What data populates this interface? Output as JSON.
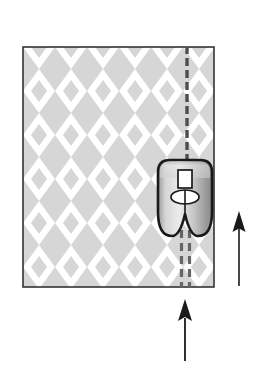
{
  "figure": {
    "title": "Presser foot stitching on argyle fabric",
    "canvas": {
      "width": 263,
      "height": 373,
      "background": "#ffffff"
    }
  },
  "fabric": {
    "name": "fabric-swatch",
    "x": 23,
    "y": 47,
    "width": 191,
    "height": 240,
    "fill": "#ffffff",
    "border_color": "#333333",
    "border_width": 1.6,
    "pattern": {
      "type": "argyle-diamond",
      "diamond_width": 32,
      "diamond_height": 44,
      "diamond_fill": "#cfcfcf",
      "diamond_opacity": 0.85
    }
  },
  "stitch_upper": {
    "name": "stitch-line-upper",
    "x": 187,
    "y_start": 47,
    "y_end": 163,
    "color": "#4d4d4d",
    "width": 3.4,
    "dash": "8 4",
    "lines": 1
  },
  "stitch_lower": {
    "name": "stitch-line-lower-double",
    "x_left": 181.5,
    "x_right": 189.5,
    "y_start": 232,
    "y_end": 285,
    "color": "#666666",
    "width": 3.2,
    "dash": "8 5",
    "lines": 2
  },
  "presser_foot": {
    "name": "presser-foot",
    "x": 157,
    "y": 160,
    "width": 56,
    "height": 78,
    "body_fill_light": "#e8e8e8",
    "body_fill_mid": "#b8b8b8",
    "body_fill_dark": "#8f8f8f",
    "outline_color": "#1a1a1a",
    "outline_width": 2.6,
    "needle_slot": {
      "name": "needle-slot-opening",
      "x": 178,
      "y": 170,
      "width": 14,
      "height": 18,
      "fill": "#ffffff",
      "stroke": "#1a1a1a"
    },
    "oval": {
      "name": "foot-oval-marking",
      "cx": 185,
      "cy": 197,
      "rx": 14,
      "ry": 7,
      "fill": "#ffffff",
      "stroke": "#1a1a1a"
    }
  },
  "arrows": [
    {
      "name": "feed-direction-arrow-right",
      "label": "",
      "x": 239,
      "y_tail": 286,
      "y_tip": 212,
      "shaft_width": 1.6,
      "head_width": 13,
      "head_length": 20,
      "color": "#1a1a1a",
      "direction": "up"
    },
    {
      "name": "feed-direction-arrow-bottom",
      "label": "",
      "x": 185,
      "y_tail": 360,
      "y_tip": 300,
      "shaft_width": 1.8,
      "head_width": 14,
      "head_length": 21,
      "color": "#1a1a1a",
      "direction": "up"
    }
  ]
}
